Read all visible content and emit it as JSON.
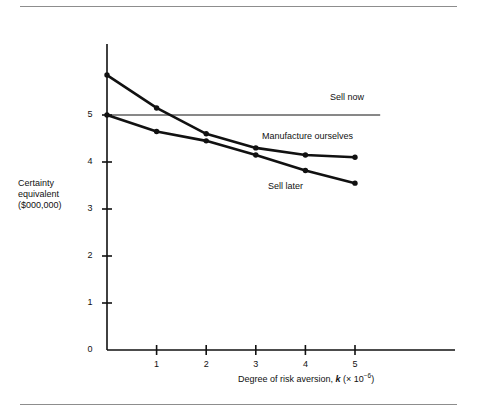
{
  "figure": {
    "y_axis_title": "Certainty\nequivalent\n($000,000)",
    "x_axis_title_main": "Degree of risk aversion, ",
    "x_axis_title_symbol": "k",
    "x_axis_title_factor": " (× 10",
    "x_axis_title_exponent": "−6",
    "x_axis_title_close": ")"
  },
  "labels": {
    "sell_now": "Sell now",
    "manufacture_ourselves": "Manufacture ourselves",
    "sell_later": "Sell later"
  },
  "chart_data": {
    "type": "line",
    "title": "",
    "subtitle": "",
    "xlabel": "Degree of risk aversion, k (× 10−6)",
    "ylabel": "Certainty equivalent ($000,000)",
    "xlim": [
      0,
      5.5
    ],
    "ylim": [
      0,
      6
    ],
    "grid": false,
    "legend_position": "inline-annotations",
    "x_ticks": [
      0,
      1,
      2,
      3,
      4,
      5
    ],
    "x_tick_labels": [
      "",
      "1",
      "2",
      "3",
      "4",
      "5"
    ],
    "y_ticks": [
      0,
      1,
      2,
      3,
      4,
      5
    ],
    "y_tick_labels": [
      "0",
      "1",
      "2",
      "3",
      "4",
      "5"
    ],
    "series": [
      {
        "name": "Sell now",
        "x": [
          0,
          5.5
        ],
        "values": [
          5.0,
          5.0
        ],
        "markers": false,
        "line_width": 1,
        "color": "#111111"
      },
      {
        "name": "Manufacture ourselves",
        "x": [
          0,
          1,
          2,
          3,
          4,
          5
        ],
        "values": [
          5.85,
          5.15,
          4.6,
          4.3,
          4.15,
          4.1
        ],
        "markers": true,
        "line_width": 2.6,
        "color": "#111111"
      },
      {
        "name": "Sell later",
        "x": [
          0,
          1,
          2,
          3,
          4,
          5
        ],
        "values": [
          5.0,
          4.65,
          4.45,
          4.15,
          3.82,
          3.55
        ],
        "markers": true,
        "line_width": 2.6,
        "color": "#111111"
      }
    ],
    "annotations": [
      {
        "text": "Sell now",
        "x": 4.5,
        "y": 5.25
      },
      {
        "text": "Manufacture ourselves",
        "x": 3.1,
        "y": 4.45
      },
      {
        "text": "Sell later",
        "x": 3.2,
        "y": 3.55
      }
    ]
  }
}
